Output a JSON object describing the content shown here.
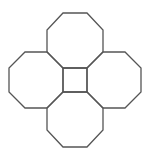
{
  "diagram": {
    "stroke_color": "#555555",
    "fill_color": "#ffffff",
    "stroke_width": 1.3,
    "shapes": [
      {
        "name": "octagon-top",
        "points": "63,13 87,13 103,30 103,52 87,68 63,68 47,52 47,30"
      },
      {
        "name": "octagon-left",
        "points": "25,52 47,52 63,68 63,92 47,108 25,108 9,92 9,68"
      },
      {
        "name": "octagon-right",
        "points": "103,52 125,52 141,68 141,92 125,108 103,108 87,92 87,68"
      },
      {
        "name": "octagon-bottom",
        "points": "63,92 87,92 103,108 103,130 87,147 63,147 47,130 47,108"
      },
      {
        "name": "center-square",
        "points": "63,68 87,68 87,92 63,92"
      }
    ]
  }
}
